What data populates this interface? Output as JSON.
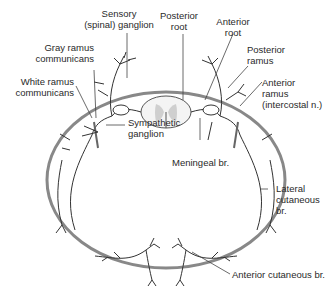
{
  "diagram": {
    "type": "anatomical cross-section",
    "labels": {
      "sensory_ganglion": "Sensory\n(spinal) ganglion",
      "posterior_root": "Posterior\nroot",
      "anterior_root": "Anterior\nroot",
      "gray_ramus": "Gray ramus\ncommunicans",
      "posterior_ramus": "Posterior\nramus",
      "white_ramus": "White ramus\ncommunicans",
      "anterior_ramus": "Anterior\nramus\n(intercostal n.)",
      "sympathetic_ganglion": "Sympathetic\nganglion",
      "meningeal_branch": "Meningeal br.",
      "lateral_cutaneous": "Lateral\ncutaneous\nbr.",
      "anterior_cutaneous": "Anterior cutaneous br."
    },
    "colors": {
      "line": "#333333",
      "body_wall": "#777777",
      "cord_gray": "#cfcfcf",
      "text": "#2a2a2a"
    }
  }
}
